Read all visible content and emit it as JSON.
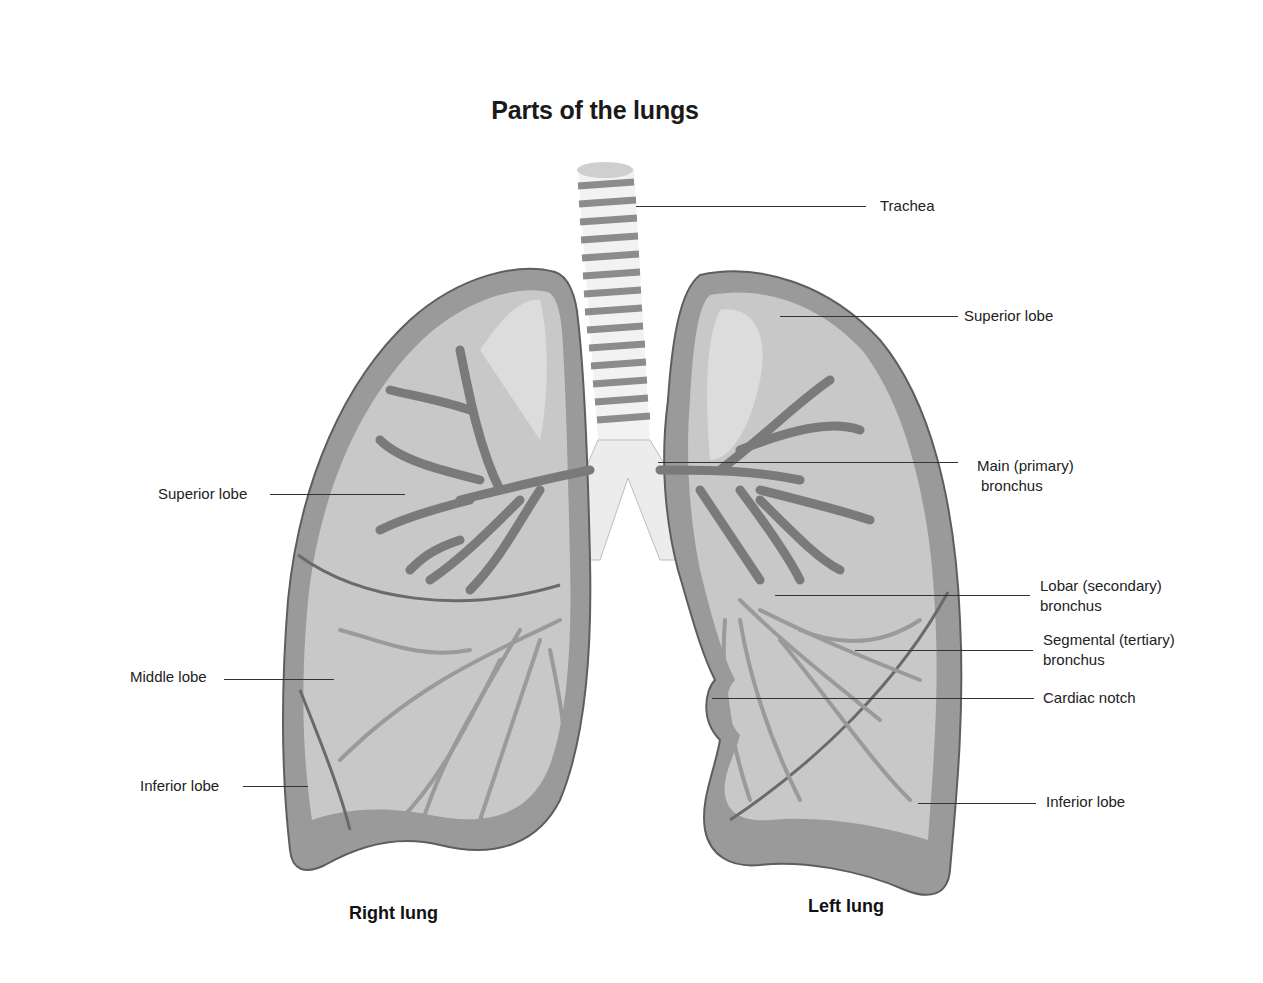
{
  "title": "Parts of the lungs",
  "lungs": {
    "right": "Right lung",
    "left": "Left lung"
  },
  "labels": {
    "trachea": "Trachea",
    "left_superior_lobe": "Superior lobe",
    "main_bronchus_line1": "Main (primary)",
    "main_bronchus_line2": "bronchus",
    "lobar_bronchus_line1": "Lobar (secondary)",
    "lobar_bronchus_line2": "bronchus",
    "segmental_bronchus_line1": "Segmental (tertiary)",
    "segmental_bronchus_line2": "bronchus",
    "cardiac_notch": "Cardiac notch",
    "left_inferior_lobe": "Inferior lobe",
    "right_superior_lobe": "Superior lobe",
    "right_middle_lobe": "Middle lobe",
    "right_inferior_lobe": "Inferior lobe"
  },
  "colors": {
    "lung_outline": "#6e6e6e",
    "lung_border": "#8a8a8a",
    "lung_fill": "#c9c9c9",
    "lung_light": "#dedede",
    "bronchi": "#7d7d7d",
    "trachea_ring": "#8c8c8c"
  }
}
